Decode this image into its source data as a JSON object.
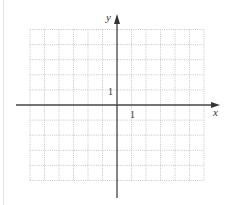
{
  "chart_data": {
    "type": "scatter",
    "title": "",
    "xlabel": "x",
    "ylabel": "y",
    "xlim": [
      -6,
      6
    ],
    "ylim": [
      -5,
      5
    ],
    "x_tick_label": "1",
    "y_tick_label": "1",
    "grid": true,
    "grid_style": "dotted",
    "series": []
  },
  "axes": {
    "x_label": "x",
    "y_label": "y",
    "x_unit_label": "1",
    "y_unit_label": "1"
  },
  "colors": {
    "grid": "#b8b8b8",
    "axis": "#333333",
    "border": "#e4e4e4"
  }
}
